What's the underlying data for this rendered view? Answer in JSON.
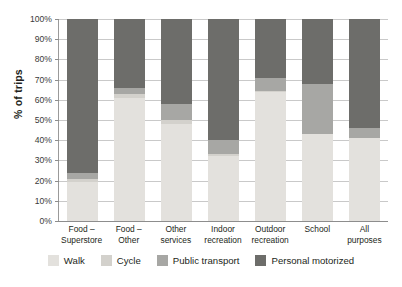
{
  "chart_data": {
    "type": "bar",
    "subtype": "stacked-bar-100-percent",
    "title": "",
    "xlabel": "",
    "ylabel": "% of trips",
    "ylim": [
      0,
      100
    ],
    "ytick_labels": [
      "100%",
      "90%",
      "80%",
      "70%",
      "60%",
      "50%",
      "40%",
      "30%",
      "20%",
      "10%",
      "0%"
    ],
    "ytick_values": [
      100,
      90,
      80,
      70,
      60,
      50,
      40,
      30,
      20,
      10,
      0
    ],
    "grid": true,
    "legend_position": "bottom",
    "categories": [
      "Food –\nSuperstore",
      "Food –\nOther",
      "Other\nservices",
      "Indoor\nrecreation",
      "Outdoor\nrecreation",
      "School",
      "All\npurposes"
    ],
    "series": [
      {
        "name": "Walk",
        "color": "#e3e1dd",
        "values": [
          19.5,
          61.0,
          48.0,
          32.0,
          64.0,
          43.0,
          41.0
        ]
      },
      {
        "name": "Cycle",
        "color": "#d3d1cc",
        "values": [
          1.5,
          2.0,
          2.0,
          1.0,
          0.5,
          0.0,
          0.0
        ]
      },
      {
        "name": "Public transport",
        "color": "#a7a7a4",
        "values": [
          3.0,
          3.0,
          8.0,
          7.0,
          6.5,
          25.0,
          5.0
        ]
      },
      {
        "name": "Personal motorized",
        "color": "#6d6d6a",
        "values": [
          76.0,
          34.0,
          42.0,
          60.0,
          29.0,
          32.0,
          54.0
        ]
      }
    ]
  },
  "legend": {
    "items": [
      {
        "label": "Walk"
      },
      {
        "label": "Cycle"
      },
      {
        "label": "Public transport"
      },
      {
        "label": "Personal motorized"
      }
    ]
  },
  "colors": {
    "walk": "#e3e1dd",
    "cycle": "#d3d1cc",
    "public_transport": "#a7a7a4",
    "personal_motorized": "#6d6d6a",
    "gridline": "#c9c9c9",
    "axis": "#8d8d8d",
    "text": "#231f20",
    "background": "#ffffff"
  }
}
